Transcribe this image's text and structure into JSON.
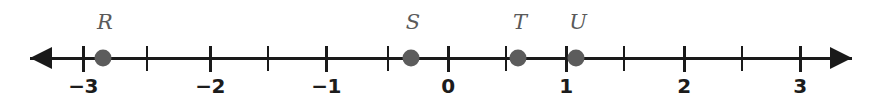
{
  "figure": {
    "type": "number-line",
    "title": "",
    "background_color": "#ffffff",
    "line_color": "#1a1a1a",
    "point_color": "#5c5c5c",
    "label_color": "#5a5a5a",
    "tick_label_color": "#1c1c1c"
  },
  "chart_data": {
    "type": "scatter",
    "title": "",
    "xlabel": "",
    "ylabel": "",
    "xlim": [
      -3.3,
      3.35
    ],
    "grid": false,
    "legend": "none",
    "axis": {
      "orientation": "horizontal",
      "left_arrow": true,
      "right_arrow": true,
      "major_tick_step": 1,
      "minor_tick_step": 0.5,
      "tick_values": [
        -3,
        -2.5,
        -2,
        -1.5,
        -1,
        -0.5,
        0,
        0.5,
        1,
        1.5,
        2,
        2.5,
        3
      ],
      "labeled_ticks": [
        {
          "value": -3,
          "label": "−3",
          "x": 83
        },
        {
          "value": -2,
          "label": "−2",
          "x": 210
        },
        {
          "value": -1,
          "label": "−1",
          "x": 326
        },
        {
          "value": 0,
          "label": "0",
          "x": 448
        },
        {
          "value": 1,
          "label": "1",
          "x": 566
        },
        {
          "value": 2,
          "label": "2",
          "x": 684
        },
        {
          "value": 3,
          "label": "3",
          "x": 800
        }
      ],
      "unlabeled_ticks": [
        {
          "value": -2.5,
          "x": 147
        },
        {
          "value": -1.5,
          "x": 268
        },
        {
          "value": -0.5,
          "x": 388
        },
        {
          "value": 0.5,
          "x": 506
        },
        {
          "value": 1.5,
          "x": 624
        },
        {
          "value": 2.5,
          "x": 742
        }
      ]
    },
    "points": [
      {
        "name": "R",
        "value": -2.7,
        "x": 103
      },
      {
        "name": "S",
        "value": -0.3,
        "x": 411
      },
      {
        "name": "T",
        "value": 0.6,
        "x": 518
      },
      {
        "name": "U",
        "value": 1.1,
        "x": 576
      }
    ]
  }
}
